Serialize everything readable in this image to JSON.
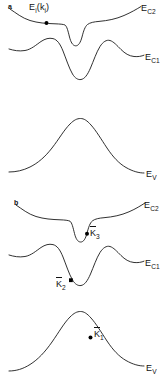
{
  "figure": {
    "type": "band-structure-diagram",
    "width": 167,
    "height": 390,
    "background_color": "#ffffff",
    "line_color": "#1a1a1a",
    "marker_color": "#000000"
  },
  "panels": [
    {
      "letter": "a",
      "curves": [
        {
          "name": "upper-conduction-band",
          "label": "E",
          "label_sub": "C2",
          "shape": "shallow-dip-with-narrow-deep-notch"
        },
        {
          "name": "lower-conduction-band",
          "label": "E",
          "label_sub": "C1",
          "shape": "two-humps-with-deep-central-valley"
        },
        {
          "name": "valence-band",
          "label": "E",
          "label_sub": "V",
          "shape": "single-broad-peak"
        }
      ],
      "annotations": [
        {
          "name": "initial-state-label",
          "text": "E",
          "sub1": "i",
          "open_paren": "(",
          "text2": "k",
          "sub2": "i",
          "close_paren": ")",
          "has_dot": true
        }
      ]
    },
    {
      "letter": "b",
      "curves": [
        {
          "name": "upper-conduction-band",
          "label": "E",
          "label_sub": "C2",
          "shape": "shallow-dip-with-narrow-deep-notch"
        },
        {
          "name": "lower-conduction-band",
          "label": "E",
          "label_sub": "C1",
          "shape": "two-humps-with-deep-central-valley"
        },
        {
          "name": "valence-band",
          "label": "E",
          "label_sub": "V",
          "shape": "single-broad-peak"
        }
      ],
      "annotations": [
        {
          "name": "k3-vector-label",
          "symbol": "K",
          "sub": "3",
          "accent": "bar",
          "has_dot": true
        },
        {
          "name": "k2-vector-label",
          "symbol": "K",
          "sub": "2",
          "accent": "bar",
          "has_dot": true
        },
        {
          "name": "k1-vector-label",
          "symbol": "K",
          "sub": "1",
          "accent": "bar",
          "has_dot": true
        }
      ]
    }
  ],
  "labels": {
    "panel_a_letter": "a",
    "panel_b_letter": "b",
    "E": "E",
    "sub_C2": "C2",
    "sub_C1": "C1",
    "sub_V": "V",
    "sub_i": "i",
    "k": "k",
    "K": "K",
    "sub_1": "1",
    "sub_2": "2",
    "sub_3": "3",
    "paren_open": "(",
    "paren_close": ")"
  }
}
